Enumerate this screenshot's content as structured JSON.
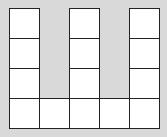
{
  "diagram": {
    "background_color": "#d9d9d9",
    "square_fill": "#ffffff",
    "line_color": "#222222",
    "cell_size_px": 30,
    "origin_px": [
      9,
      8
    ],
    "cells": [
      {
        "col": 0,
        "row": 0
      },
      {
        "col": 2,
        "row": 0
      },
      {
        "col": 4,
        "row": 0
      },
      {
        "col": 0,
        "row": 1
      },
      {
        "col": 2,
        "row": 1
      },
      {
        "col": 4,
        "row": 1
      },
      {
        "col": 0,
        "row": 2
      },
      {
        "col": 2,
        "row": 2
      },
      {
        "col": 4,
        "row": 2
      },
      {
        "col": 0,
        "row": 3
      },
      {
        "col": 1,
        "row": 3
      },
      {
        "col": 2,
        "row": 3
      },
      {
        "col": 3,
        "row": 3
      },
      {
        "col": 4,
        "row": 3
      }
    ],
    "total_squares": 14
  }
}
